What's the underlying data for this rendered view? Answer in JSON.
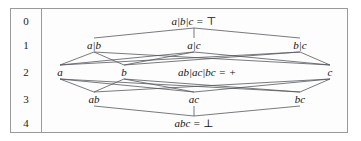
{
  "figure": {
    "kind": "hasse-diagram",
    "colors": {
      "frame": "#9a9a9a",
      "background": "#fdfdfd",
      "edge": "#55585c",
      "text": "#121212"
    }
  },
  "rank_axis": {
    "labels": [
      "0",
      "1",
      "2",
      "3",
      "4"
    ],
    "rows_y": [
      12,
      36,
      63,
      90,
      114
    ]
  },
  "nodes": [
    {
      "id": "top",
      "label": "a|b|c = ⊤",
      "rank": 0,
      "x": 152,
      "y": 12
    },
    {
      "id": "ab_c",
      "label": "a|b",
      "rank": 1,
      "x": 52,
      "y": 36
    },
    {
      "id": "a_c",
      "label": "a|c",
      "rank": 1,
      "x": 152,
      "y": 36
    },
    {
      "id": "b_c",
      "label": "b|c",
      "rank": 1,
      "x": 258,
      "y": 36
    },
    {
      "id": "a",
      "label": "a",
      "rank": 2,
      "x": 18,
      "y": 63
    },
    {
      "id": "b",
      "label": "b",
      "rank": 2,
      "x": 82,
      "y": 63
    },
    {
      "id": "mid",
      "label": "ab|ac|bc = +",
      "rank": 2,
      "x": 165,
      "y": 63
    },
    {
      "id": "c",
      "label": "c",
      "rank": 2,
      "x": 288,
      "y": 63
    },
    {
      "id": "ab",
      "label": "ab",
      "rank": 3,
      "x": 52,
      "y": 90
    },
    {
      "id": "ac",
      "label": "ac",
      "rank": 3,
      "x": 152,
      "y": 90
    },
    {
      "id": "bc",
      "label": "bc",
      "rank": 3,
      "x": 258,
      "y": 90
    },
    {
      "id": "bottom",
      "label": "abc = ⊥",
      "rank": 4,
      "x": 152,
      "y": 114
    }
  ],
  "edges": [
    {
      "from": "top",
      "to": "ab_c"
    },
    {
      "from": "top",
      "to": "a_c"
    },
    {
      "from": "top",
      "to": "b_c"
    },
    {
      "from": "ab_c",
      "to": "a"
    },
    {
      "from": "ab_c",
      "to": "b"
    },
    {
      "from": "ab_c",
      "to": "c"
    },
    {
      "from": "a_c",
      "to": "a"
    },
    {
      "from": "a_c",
      "to": "b"
    },
    {
      "from": "a_c",
      "to": "c"
    },
    {
      "from": "b_c",
      "to": "a"
    },
    {
      "from": "b_c",
      "to": "b"
    },
    {
      "from": "b_c",
      "to": "c"
    },
    {
      "from": "a",
      "to": "ab"
    },
    {
      "from": "a",
      "to": "ac"
    },
    {
      "from": "a",
      "to": "bc"
    },
    {
      "from": "b",
      "to": "ab"
    },
    {
      "from": "b",
      "to": "ac"
    },
    {
      "from": "b",
      "to": "bc"
    },
    {
      "from": "c",
      "to": "ab"
    },
    {
      "from": "c",
      "to": "ac"
    },
    {
      "from": "c",
      "to": "bc"
    },
    {
      "from": "ab",
      "to": "bottom"
    },
    {
      "from": "ac",
      "to": "bottom"
    },
    {
      "from": "bc",
      "to": "bottom"
    }
  ]
}
